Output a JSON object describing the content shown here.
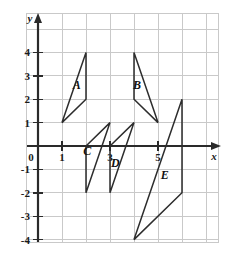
{
  "chart_data": {
    "type": "scatter",
    "title": "",
    "xlabel": "x",
    "ylabel": "y",
    "xlim": [
      -0.6,
      7.2
    ],
    "ylim": [
      -4.4,
      5.3
    ],
    "grid": true,
    "legend_position": "none",
    "x_ticks": [
      {
        "value": 0,
        "label": "0"
      },
      {
        "value": 1,
        "label": "1"
      },
      {
        "value": 3,
        "label": "3"
      },
      {
        "value": 5,
        "label": "5"
      }
    ],
    "y_ticks": [
      {
        "value": 4,
        "label": "4"
      },
      {
        "value": 3,
        "label": "3"
      },
      {
        "value": 2,
        "label": "2"
      },
      {
        "value": 1,
        "label": "1"
      },
      {
        "value": -1,
        "label": "-1"
      },
      {
        "value": -2,
        "label": "-2"
      },
      {
        "value": -3,
        "label": "-3"
      },
      {
        "value": -4,
        "label": "-4"
      }
    ],
    "shapes": [
      {
        "name": "A",
        "label": "A",
        "vertices": [
          [
            1,
            1
          ],
          [
            2,
            4
          ],
          [
            2,
            2
          ]
        ],
        "label_position": [
          1.62,
          2.42
        ]
      },
      {
        "name": "B",
        "label": "B",
        "vertices": [
          [
            4,
            4
          ],
          [
            4,
            2
          ],
          [
            5,
            1
          ]
        ],
        "label_position": [
          4.13,
          2.42
        ]
      },
      {
        "name": "C",
        "label": "C",
        "vertices": [
          [
            2,
            0
          ],
          [
            3,
            1
          ],
          [
            2,
            -2
          ]
        ],
        "label_position": [
          2.05,
          -0.38
        ]
      },
      {
        "name": "D",
        "label": "D",
        "vertices": [
          [
            3,
            0
          ],
          [
            4,
            1
          ],
          [
            3,
            -2
          ]
        ],
        "label_position": [
          3.22,
          -0.88
        ]
      },
      {
        "name": "E",
        "label": "E",
        "vertices": [
          [
            4,
            -4
          ],
          [
            6,
            2
          ],
          [
            6,
            -2
          ]
        ],
        "label_position": [
          5.28,
          -1.42
        ]
      }
    ]
  },
  "axes": {
    "x_axis_name": "x",
    "y_axis_name": "y",
    "origin_label": "0"
  }
}
